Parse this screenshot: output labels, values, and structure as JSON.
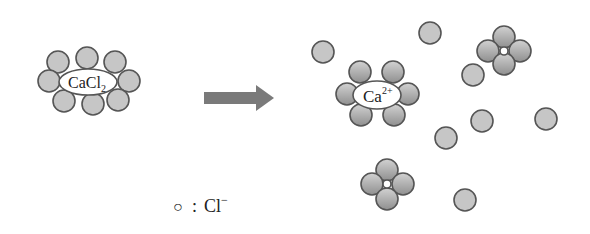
{
  "diagram": {
    "type": "dissolution",
    "reactant": {
      "label": "CaCl",
      "subscript": "2"
    },
    "arrow": {
      "color": "#7a7a7a"
    },
    "hydrated_cation": {
      "label": "Ca",
      "superscript": "2+"
    },
    "legend": {
      "symbol": "○",
      "separator": ":",
      "ion": "Cl",
      "charge": "−"
    },
    "colors": {
      "sphere_fill": "#c4c4c4",
      "sphere_stroke": "#555555",
      "text": "#222222"
    }
  }
}
